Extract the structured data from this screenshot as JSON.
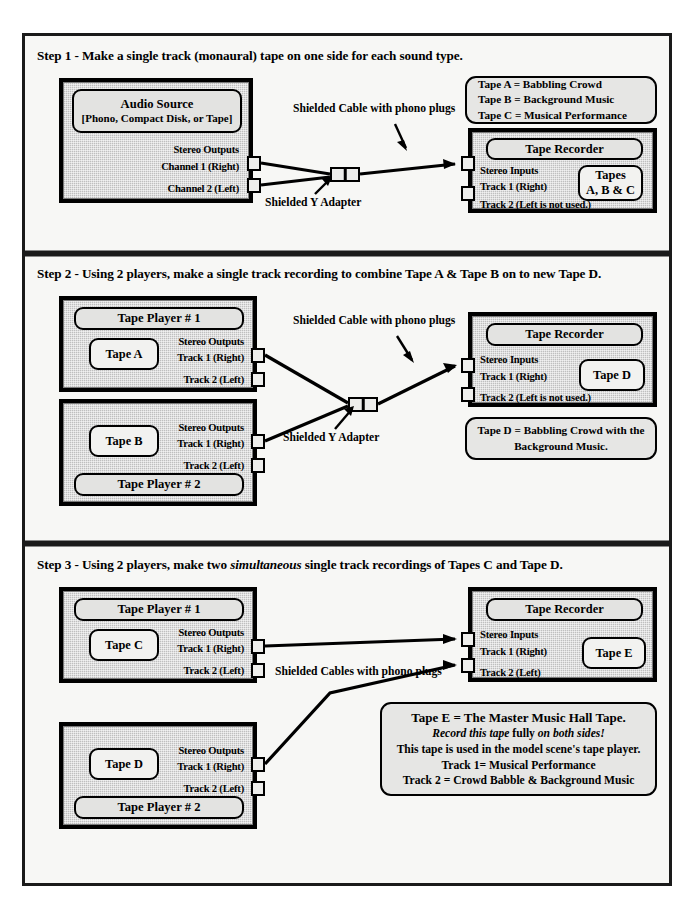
{
  "document": {
    "title": "Music Hall Tape Production Steps"
  },
  "steps": [
    {
      "id": "step1",
      "title_prefix": "Step 1 - Make a single track (monaural) tape on one side for each sound type.",
      "source_device": {
        "name": "audio-source",
        "plate_line1": "Audio Source",
        "plate_line2": "[Phono, Compact Disk, or Tape]",
        "outputs_label": "Stereo Outputs",
        "port1": "Channel 1 (Right)",
        "port2": "Channel 2 (Left)"
      },
      "cable_label": "Shielded Cable with phono plugs",
      "adapter_label": "Shielded Y Adapter",
      "legend": [
        "Tape A = Babbling Crowd",
        "Tape B = Background Music",
        "Tape C = Musical Performance"
      ],
      "recorder": {
        "plate": "Tape Recorder",
        "inputs_label": "Stereo Inputs",
        "port1": "Track 1 (Right)",
        "port2": "Track 2 (Left is not used.)",
        "tape_line1": "Tapes",
        "tape_line2": "A, B & C"
      }
    },
    {
      "id": "step2",
      "title_prefix": "Step 2 - Using 2 players, make a single track recording to combine Tape A & Tape B on to new Tape D.",
      "player1": {
        "header": "Tape Player  # 1",
        "tape": "Tape A",
        "outputs_label": "Stereo Outputs",
        "port1": "Track 1 (Right)",
        "port2": "Track 2 (Left)"
      },
      "player2": {
        "footer": "Tape Player  # 2",
        "tape": "Tape B",
        "outputs_label": "Stereo Outputs",
        "port1": "Track 1 (Right)",
        "port2": "Track 2 (Left)"
      },
      "cable_label": "Shielded Cable with phono plugs",
      "adapter_label": "Shielded Y Adapter",
      "recorder": {
        "plate": "Tape Recorder",
        "inputs_label": "Stereo Inputs",
        "port1": "Track 1 (Right)",
        "port2": "Track 2 (Left is not used.)",
        "tape": "Tape D"
      },
      "result_note_line1": "Tape D = Babbling Crowd with the",
      "result_note_line2": "Background Music."
    },
    {
      "id": "step3",
      "title_prefix_a": "Step 3  - Using 2 players, make two ",
      "title_italic": "simultaneous",
      "title_prefix_b": " single track recordings of Tapes C and Tape D.",
      "player1": {
        "header": "Tape Player  # 1",
        "tape": "Tape C",
        "outputs_label": "Stereo Outputs",
        "port1": "Track 1 (Right)",
        "port2": "Track 2 (Left)"
      },
      "player2": {
        "footer": "Tape Player  # 2",
        "tape": "Tape D",
        "outputs_label": "Stereo Outputs",
        "port1": "Track 1 (Right)",
        "port2": "Track 2 (Left)"
      },
      "cable_label": "Shielded Cables with phono plugs",
      "recorder": {
        "plate": "Tape Recorder",
        "inputs_label": "Stereo Inputs",
        "port1": "Track 1 (Right)",
        "port2": "Track 2 (Left)",
        "tape": "Tape E"
      },
      "master_note": {
        "line1": "Tape E = The Master Music Hall Tape.",
        "line2_italic_a": "Record this tape",
        "line2_plain": " fully ",
        "line2_italic_b": "on both sides!",
        "line3": "This tape is used in the model scene's tape player.",
        "line4": "Track 1= Musical Performance",
        "line5": "Track 2 = Crowd Babble & Background Music"
      }
    }
  ],
  "colors": {
    "frame": "#1a1a1a",
    "device_fill": "#bfbfbf",
    "plate_fill": "#e3e3e1",
    "page_bg": "#f7f7f5"
  }
}
